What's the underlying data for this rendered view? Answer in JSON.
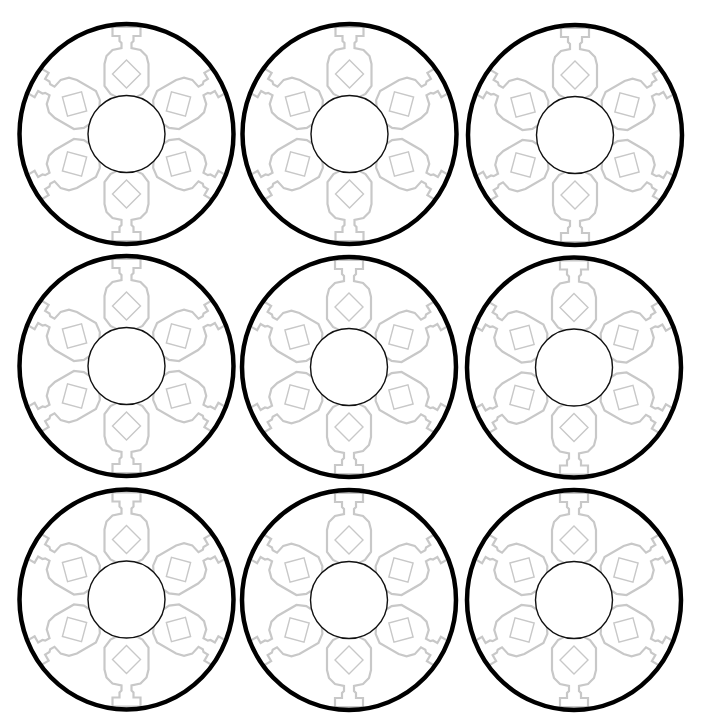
{
  "canvas": {
    "width": 703,
    "height": 726,
    "background": "#ffffff"
  },
  "grid": {
    "rows": 3,
    "cols": 3
  },
  "colors": {
    "outer_ring": "#000000",
    "inner_ring": "#111111",
    "petal": "#c8c8c8"
  },
  "medallion": {
    "outer_rx": 107,
    "outer_ry": 110,
    "inner_r": 38.5,
    "petal_count": 6,
    "petal_angles_deg": [
      0,
      60,
      120,
      180,
      240,
      300
    ]
  },
  "medallions": [
    {
      "id": 1,
      "row": 1,
      "col": 1,
      "cx": 126.5,
      "cy": 134
    },
    {
      "id": 2,
      "row": 1,
      "col": 2,
      "cx": 349.5,
      "cy": 134
    },
    {
      "id": 3,
      "row": 1,
      "col": 3,
      "cx": 575,
      "cy": 135
    },
    {
      "id": 4,
      "row": 2,
      "col": 1,
      "cx": 126.5,
      "cy": 366
    },
    {
      "id": 5,
      "row": 2,
      "col": 2,
      "cx": 349,
      "cy": 367
    },
    {
      "id": 6,
      "row": 2,
      "col": 3,
      "cx": 574,
      "cy": 367.5
    },
    {
      "id": 7,
      "row": 3,
      "col": 1,
      "cx": 126.5,
      "cy": 599.5
    },
    {
      "id": 8,
      "row": 3,
      "col": 2,
      "cx": 349,
      "cy": 600
    },
    {
      "id": 9,
      "row": 3,
      "col": 3,
      "cx": 574,
      "cy": 600
    }
  ]
}
